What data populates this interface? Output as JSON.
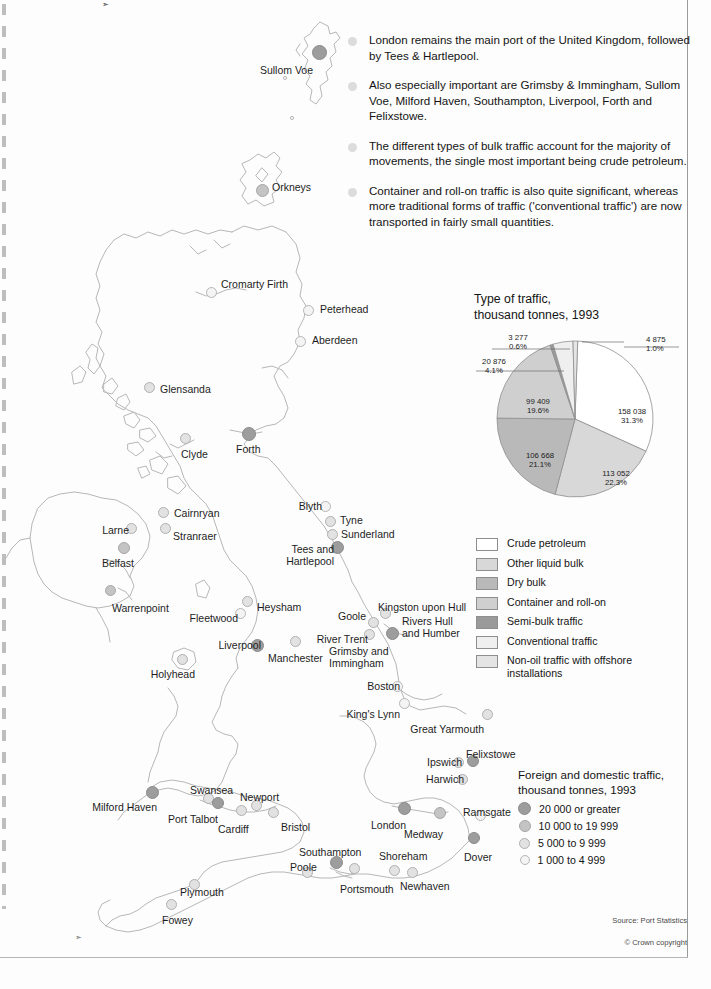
{
  "bullets": [
    "London remains the main port of the United Kingdom, followed by Tees & Hartlepool.",
    "Also especially important are Grimsby & Immingham, Sullom Voe, Milford Haven, Southampton, Liverpool, Forth and Felixstowe.",
    "The different types of bulk traffic account for the majority of movements, the single most important being crude petroleum.",
    "Container and roll-on traffic is also quite significant, whereas more traditional forms of traffic ('conventional traffic') are now transported in fairly small quantities."
  ],
  "pie": {
    "title_line1": "Type of traffic,",
    "title_line2": "thousand tonnes, 1993"
  },
  "chart_data": {
    "type": "pie",
    "title": "Type of traffic, thousand tonnes, 1993",
    "unit": "thousand tonnes",
    "year": 1993,
    "legend_position": "below",
    "total": 506195,
    "categories": [
      "Crude petroleum",
      "Other liquid bulk",
      "Dry bulk",
      "Container and roll-on",
      "Semi-bulk traffic",
      "Conventional traffic",
      "Non-oil traffic with offshore installations"
    ],
    "values": [
      158038,
      113052,
      106668,
      99409,
      3277,
      20876,
      4875
    ],
    "percents": [
      "31.3%",
      "22.3%",
      "21.1%",
      "19.6%",
      "0.6%",
      "4.1%",
      "1.0%"
    ],
    "value_labels": [
      "158 038",
      "113 052",
      "106 668",
      "99 409",
      "3 277",
      "20 876",
      "4 875"
    ],
    "colors": [
      "#ffffff",
      "#d8d8d8",
      "#b9b9b9",
      "#cfcfcf",
      "#9a9a9a",
      "#efefef",
      "#e4e4e4"
    ]
  },
  "legend": {
    "items": [
      {
        "label": "Crude petroleum",
        "color": "#ffffff"
      },
      {
        "label": "Other liquid bulk",
        "color": "#d8d8d8"
      },
      {
        "label": "Dry bulk",
        "color": "#b9b9b9"
      },
      {
        "label": "Container and roll-on",
        "color": "#cfcfcf"
      },
      {
        "label": "Semi-bulk traffic",
        "color": "#9a9a9a"
      },
      {
        "label": "Conventional traffic",
        "color": "#efefef"
      },
      {
        "label": "Non-oil traffic with offshore installations",
        "color": "#e4e4e4"
      }
    ]
  },
  "size_legend": {
    "title_line1": "Foreign and domestic traffic,",
    "title_line2": "thousand tonnes, 1993",
    "items": [
      {
        "label": "20 000 or greater",
        "tier": "t1",
        "d": 13
      },
      {
        "label": "10 000 to 19 999",
        "tier": "t2",
        "d": 12
      },
      {
        "label": "5 000 to 9 999",
        "tier": "t3",
        "d": 11
      },
      {
        "label": "1 000 to 4 999",
        "tier": "t4",
        "d": 10
      }
    ]
  },
  "ports": [
    {
      "name": "Sullom Voe",
      "tier": "t1",
      "d": 15,
      "cx": 319,
      "cy": 52,
      "lx": 247,
      "ly": 64,
      "align": "r",
      "lw": 66
    },
    {
      "name": "Orkneys",
      "tier": "t2",
      "d": 13,
      "cx": 262,
      "cy": 190,
      "lx": 272,
      "ly": 181,
      "align": "l",
      "lw": 60
    },
    {
      "name": "Cromarty Firth",
      "tier": "t4",
      "d": 11,
      "cx": 211,
      "cy": 292,
      "lx": 221,
      "ly": 278,
      "align": "l",
      "lw": 80
    },
    {
      "name": "Peterhead",
      "tier": "t4",
      "d": 11,
      "cx": 308,
      "cy": 310,
      "lx": 320,
      "ly": 303,
      "align": "l",
      "lw": 62
    },
    {
      "name": "Aberdeen",
      "tier": "t4",
      "d": 11,
      "cx": 300,
      "cy": 341,
      "lx": 312,
      "ly": 334,
      "align": "l",
      "lw": 60
    },
    {
      "name": "Glensanda",
      "tier": "t3",
      "d": 11,
      "cx": 149,
      "cy": 387,
      "lx": 160,
      "ly": 383,
      "align": "l",
      "lw": 62
    },
    {
      "name": "Forth",
      "tier": "t1",
      "d": 14,
      "cx": 249,
      "cy": 434,
      "lx": 236,
      "ly": 443,
      "align": "l",
      "lw": 40
    },
    {
      "name": "Clyde",
      "tier": "t3",
      "d": 11,
      "cx": 185,
      "cy": 438,
      "lx": 181,
      "ly": 448,
      "align": "l",
      "lw": 40
    },
    {
      "name": "Cairnryan",
      "tier": "t3",
      "d": 11,
      "cx": 163,
      "cy": 512,
      "lx": 174,
      "ly": 507,
      "align": "l",
      "lw": 60
    },
    {
      "name": "Stranraer",
      "tier": "t3",
      "d": 11,
      "cx": 165,
      "cy": 528,
      "lx": 173,
      "ly": 530,
      "align": "l",
      "lw": 60
    },
    {
      "name": "Larne",
      "tier": "t3",
      "d": 11,
      "cx": 131,
      "cy": 528,
      "lx": 97,
      "ly": 524,
      "align": "r",
      "lw": 32
    },
    {
      "name": "Belfast",
      "tier": "t2",
      "d": 12,
      "cx": 124,
      "cy": 548,
      "lx": 92,
      "ly": 557,
      "align": "r",
      "lw": 42
    },
    {
      "name": "Warrenpoint",
      "tier": "t2",
      "d": 11,
      "cx": 110,
      "cy": 590,
      "lx": 112,
      "ly": 602,
      "align": "l",
      "lw": 72
    },
    {
      "name": "Blyth",
      "tier": "t4",
      "d": 11,
      "cx": 325,
      "cy": 506,
      "lx": 290,
      "ly": 500,
      "align": "r",
      "lw": 32
    },
    {
      "name": "Tyne",
      "tier": "t3",
      "d": 11,
      "cx": 330,
      "cy": 521,
      "lx": 340,
      "ly": 514,
      "align": "l",
      "lw": 34
    },
    {
      "name": "Sunderland",
      "tier": "t3",
      "d": 11,
      "cx": 332,
      "cy": 534,
      "lx": 341,
      "ly": 528,
      "align": "l",
      "lw": 66
    },
    {
      "name": "Tees and\nHartlepool",
      "tier": "t1",
      "d": 13,
      "cx": 337,
      "cy": 547,
      "lx": 272,
      "ly": 543,
      "align": "r",
      "lw": 62
    },
    {
      "name": "Heysham",
      "tier": "t3",
      "d": 11,
      "cx": 247,
      "cy": 601,
      "lx": 257,
      "ly": 601,
      "align": "l",
      "lw": 56
    },
    {
      "name": "Fleetwood",
      "tier": "t4",
      "d": 11,
      "cx": 240,
      "cy": 613,
      "lx": 176,
      "ly": 612,
      "align": "r",
      "lw": 62
    },
    {
      "name": "Goole",
      "tier": "t3",
      "d": 11,
      "cx": 373,
      "cy": 622,
      "lx": 320,
      "ly": 610,
      "align": "r",
      "lw": 46
    },
    {
      "name": "Kingston upon Hull",
      "tier": "t3",
      "d": 11,
      "cx": 385,
      "cy": 613,
      "lx": 378,
      "ly": 601,
      "align": "l",
      "lw": 96
    },
    {
      "name": "Rivers Hull\nand Humber",
      "tier": "t1",
      "d": 13,
      "cx": 392,
      "cy": 633,
      "lx": 402,
      "ly": 615,
      "align": "l",
      "lw": 66
    },
    {
      "name": "River Trent",
      "tier": "t3",
      "d": 11,
      "cx": 369,
      "cy": 634,
      "lx": 312,
      "ly": 633,
      "align": "r",
      "lw": 56
    },
    {
      "name": "Grimsby and\nImmingham",
      "tier": "t1",
      "d": 0,
      "cx": 0,
      "cy": 0,
      "lx": 329,
      "ly": 645,
      "align": "l",
      "lw": 72
    },
    {
      "name": "Liverpool",
      "tier": "t1",
      "d": 13,
      "cx": 257,
      "cy": 645,
      "lx": 203,
      "ly": 639,
      "align": "r",
      "lw": 58
    },
    {
      "name": "Manchester",
      "tier": "t3",
      "d": 11,
      "cx": 295,
      "cy": 641,
      "lx": 268,
      "ly": 652,
      "align": "l",
      "lw": 68
    },
    {
      "name": "Holyhead",
      "tier": "t3",
      "d": 11,
      "cx": 182,
      "cy": 659,
      "lx": 139,
      "ly": 668,
      "align": "r",
      "lw": 56
    },
    {
      "name": "Boston",
      "tier": "t4",
      "d": 11,
      "cx": 397,
      "cy": 686,
      "lx": 358,
      "ly": 680,
      "align": "r",
      "lw": 42
    },
    {
      "name": "King's Lynn",
      "tier": "t4",
      "d": 11,
      "cx": 404,
      "cy": 703,
      "lx": 332,
      "ly": 708,
      "align": "r",
      "lw": 68
    },
    {
      "name": "Great Yarmouth",
      "tier": "t3",
      "d": 11,
      "cx": 487,
      "cy": 714,
      "lx": 408,
      "ly": 723,
      "align": "r",
      "lw": 76
    },
    {
      "name": "Felixstowe",
      "tier": "t1",
      "d": 12,
      "cx": 473,
      "cy": 761,
      "lx": 466,
      "ly": 748,
      "align": "l",
      "lw": 62
    },
    {
      "name": "Ipswich",
      "tier": "t3",
      "d": 11,
      "cx": 458,
      "cy": 762,
      "lx": 418,
      "ly": 756,
      "align": "r",
      "lw": 44
    },
    {
      "name": "Harwich",
      "tier": "t3",
      "d": 11,
      "cx": 462,
      "cy": 779,
      "lx": 418,
      "ly": 773,
      "align": "r",
      "lw": 46
    },
    {
      "name": "Milford Haven",
      "tier": "t1",
      "d": 13,
      "cx": 152,
      "cy": 792,
      "lx": 83,
      "ly": 801,
      "align": "r",
      "lw": 74
    },
    {
      "name": "Swansea",
      "tier": "t3",
      "d": 11,
      "cx": 208,
      "cy": 798,
      "lx": 190,
      "ly": 784,
      "align": "l",
      "lw": 52
    },
    {
      "name": "Port Talbot",
      "tier": "t1",
      "d": 12,
      "cx": 218,
      "cy": 803,
      "lx": 168,
      "ly": 813,
      "align": "l",
      "lw": 66
    },
    {
      "name": "Newport",
      "tier": "t3",
      "d": 11,
      "cx": 256,
      "cy": 805,
      "lx": 240,
      "ly": 791,
      "align": "l",
      "lw": 50
    },
    {
      "name": "Cardiff",
      "tier": "t3",
      "d": 11,
      "cx": 241,
      "cy": 810,
      "lx": 218,
      "ly": 823,
      "align": "l",
      "lw": 44
    },
    {
      "name": "Bristol",
      "tier": "t3",
      "d": 11,
      "cx": 273,
      "cy": 812,
      "lx": 281,
      "ly": 821,
      "align": "l",
      "lw": 42
    },
    {
      "name": "London",
      "tier": "t1",
      "d": 13,
      "cx": 404,
      "cy": 808,
      "lx": 362,
      "ly": 819,
      "align": "r",
      "lw": 44
    },
    {
      "name": "Medway",
      "tier": "t2",
      "d": 12,
      "cx": 440,
      "cy": 813,
      "lx": 404,
      "ly": 828,
      "align": "l",
      "lw": 48
    },
    {
      "name": "Ramsgate",
      "tier": "t4",
      "d": 11,
      "cx": 480,
      "cy": 815,
      "lx": 463,
      "ly": 806,
      "align": "l",
      "lw": 54
    },
    {
      "name": "Dover",
      "tier": "t1",
      "d": 12,
      "cx": 474,
      "cy": 838,
      "lx": 464,
      "ly": 851,
      "align": "l",
      "lw": 40
    },
    {
      "name": "Southampton",
      "tier": "t1",
      "d": 13,
      "cx": 336,
      "cy": 862,
      "lx": 299,
      "ly": 846,
      "align": "l",
      "lw": 76
    },
    {
      "name": "Poole",
      "tier": "t3",
      "d": 11,
      "cx": 307,
      "cy": 872,
      "lx": 290,
      "ly": 861,
      "align": "l",
      "lw": 38
    },
    {
      "name": "Portsmouth",
      "tier": "t3",
      "d": 11,
      "cx": 354,
      "cy": 868,
      "lx": 340,
      "ly": 883,
      "align": "l",
      "lw": 66
    },
    {
      "name": "Shoreham",
      "tier": "t3",
      "d": 11,
      "cx": 394,
      "cy": 870,
      "lx": 379,
      "ly": 850,
      "align": "l",
      "lw": 56
    },
    {
      "name": "Newhaven",
      "tier": "t3",
      "d": 11,
      "cx": 412,
      "cy": 872,
      "lx": 400,
      "ly": 880,
      "align": "l",
      "lw": 58
    },
    {
      "name": "Plymouth",
      "tier": "t3",
      "d": 11,
      "cx": 194,
      "cy": 884,
      "lx": 180,
      "ly": 886,
      "align": "l",
      "lw": 54
    },
    {
      "name": "Fowey",
      "tier": "t3",
      "d": 11,
      "cx": 171,
      "cy": 904,
      "lx": 162,
      "ly": 914,
      "align": "l",
      "lw": 40
    }
  ],
  "source": "Source: Port Statistics",
  "copyright": "© Crown copyright"
}
